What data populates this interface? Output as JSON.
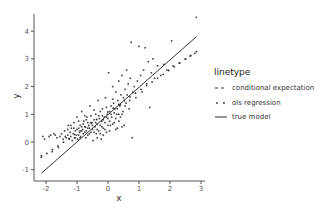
{
  "chart_data": {
    "type": "scatter",
    "title": "",
    "xlabel": "x",
    "ylabel": "y",
    "xlim": [
      -2.35,
      3.05
    ],
    "ylim": [
      -1.45,
      4.85
    ],
    "xticks": [
      -2,
      -1,
      0,
      1,
      2,
      3
    ],
    "yticks": [
      -1,
      0,
      1,
      2,
      3,
      4
    ],
    "grid": false,
    "legend": {
      "title": "linetype",
      "position": "right",
      "entries": [
        {
          "label": "conditional expectation",
          "style": "dashed"
        },
        {
          "label": "ols regression",
          "style": "dotted"
        },
        {
          "label": "true model",
          "style": "solid"
        }
      ]
    },
    "lines": [
      {
        "name": "true model",
        "style": "solid",
        "x": [
          -2.15,
          2.85
        ],
        "y": [
          -1.13,
          3.8
        ]
      },
      {
        "name": "ols regression",
        "style": "dotted",
        "x": [
          -2.15,
          2.85
        ],
        "y": [
          -0.55,
          3.26
        ]
      }
    ],
    "scatter_summary": {
      "n_points_approx": 500,
      "x_range": [
        -2.15,
        2.85
      ],
      "y_range": [
        -0.5,
        4.5
      ],
      "cluster_center": [
        -0.5,
        0.6
      ]
    },
    "points": [
      [
        -2.15,
        -0.5
      ],
      [
        -2.1,
        0.2
      ],
      [
        -2.05,
        0.1
      ],
      [
        -1.9,
        0.2
      ],
      [
        -1.85,
        0.25
      ],
      [
        -1.8,
        -0.35
      ],
      [
        -1.75,
        0.3
      ],
      [
        -1.7,
        0.25
      ],
      [
        -1.65,
        0.15
      ],
      [
        -1.6,
        -0.2
      ],
      [
        -1.55,
        0.2
      ],
      [
        -1.5,
        0.3
      ],
      [
        -1.45,
        0.1
      ],
      [
        -1.4,
        0.4
      ],
      [
        -1.38,
        0.2
      ],
      [
        -1.35,
        0.15
      ],
      [
        -1.3,
        0.25
      ],
      [
        -1.28,
        0.6
      ],
      [
        -1.25,
        0.1
      ],
      [
        -1.22,
        0.35
      ],
      [
        -1.2,
        0.2
      ],
      [
        -1.18,
        0.5
      ],
      [
        -1.15,
        0.05
      ],
      [
        -1.12,
        0.3
      ],
      [
        -1.1,
        0.7
      ],
      [
        -1.08,
        0.15
      ],
      [
        -1.05,
        0.4
      ],
      [
        -1.02,
        0.25
      ],
      [
        -1.0,
        0.9
      ],
      [
        -0.98,
        0.1
      ],
      [
        -0.95,
        0.5
      ],
      [
        -0.92,
        0.35
      ],
      [
        -0.9,
        0.6
      ],
      [
        -0.88,
        0.2
      ],
      [
        -0.85,
        1.1
      ],
      [
        -0.82,
        0.45
      ],
      [
        -0.8,
        0.3
      ],
      [
        -0.78,
        0.75
      ],
      [
        -0.75,
        0.55
      ],
      [
        -0.72,
        0.15
      ],
      [
        -0.7,
        0.4
      ],
      [
        -0.68,
        0.9
      ],
      [
        -0.65,
        0.25
      ],
      [
        -0.62,
        0.6
      ],
      [
        -0.6,
        0.5
      ],
      [
        -0.58,
        1.3
      ],
      [
        -0.55,
        0.35
      ],
      [
        -0.52,
        0.7
      ],
      [
        -0.5,
        0.45
      ],
      [
        -0.48,
        0.05
      ],
      [
        -0.45,
        0.8
      ],
      [
        -0.42,
        0.55
      ],
      [
        -0.4,
        1.0
      ],
      [
        -0.38,
        0.3
      ],
      [
        -0.35,
        0.65
      ],
      [
        -0.32,
        1.5
      ],
      [
        -0.3,
        0.4
      ],
      [
        -0.28,
        0.85
      ],
      [
        -0.25,
        0.6
      ],
      [
        -0.22,
        0.1
      ],
      [
        -0.2,
        0.75
      ],
      [
        -0.18,
        1.2
      ],
      [
        -0.15,
        0.5
      ],
      [
        -0.12,
        0.9
      ],
      [
        -0.1,
        0.7
      ],
      [
        -0.08,
        1.6
      ],
      [
        -0.05,
        0.35
      ],
      [
        -0.02,
        1.0
      ],
      [
        0.0,
        0.85
      ],
      [
        0.02,
        2.5
      ],
      [
        0.05,
        1.1
      ],
      [
        0.08,
        0.6
      ],
      [
        0.1,
        1.3
      ],
      [
        0.12,
        0.9
      ],
      [
        0.15,
        2.0
      ],
      [
        0.18,
        1.4
      ],
      [
        0.2,
        0.7
      ],
      [
        0.22,
        1.2
      ],
      [
        0.25,
        1.8
      ],
      [
        0.28,
        1.0
      ],
      [
        0.3,
        0.5
      ],
      [
        0.32,
        1.5
      ],
      [
        0.35,
        2.2
      ],
      [
        0.38,
        1.3
      ],
      [
        0.4,
        0.9
      ],
      [
        0.42,
        1.7
      ],
      [
        0.45,
        2.4
      ],
      [
        0.48,
        1.1
      ],
      [
        0.5,
        1.6
      ],
      [
        0.52,
        0.6
      ],
      [
        0.55,
        1.9
      ],
      [
        0.58,
        1.4
      ],
      [
        0.6,
        2.6
      ],
      [
        0.62,
        1.7
      ],
      [
        0.65,
        2.1
      ],
      [
        0.68,
        1.2
      ],
      [
        0.7,
        1.5
      ],
      [
        0.72,
        2.3
      ],
      [
        0.75,
        3.6
      ],
      [
        0.78,
        0.15
      ],
      [
        0.8,
        1.8
      ],
      [
        0.85,
        2.0
      ],
      [
        0.9,
        1.6
      ],
      [
        0.95,
        2.2
      ],
      [
        1.0,
        3.45
      ],
      [
        1.05,
        2.4
      ],
      [
        1.1,
        1.8
      ],
      [
        1.15,
        2.6
      ],
      [
        1.2,
        3.4
      ],
      [
        1.25,
        2.1
      ],
      [
        1.3,
        2.9
      ],
      [
        1.35,
        1.25
      ],
      [
        1.4,
        2.5
      ],
      [
        1.45,
        3.0
      ],
      [
        1.5,
        2.3
      ],
      [
        1.6,
        2.75
      ],
      [
        1.7,
        2.4
      ],
      [
        1.8,
        2.8
      ],
      [
        1.9,
        2.6
      ],
      [
        2.05,
        3.65
      ],
      [
        2.1,
        2.75
      ],
      [
        2.3,
        2.85
      ],
      [
        2.5,
        3.0
      ],
      [
        2.65,
        3.1
      ],
      [
        2.8,
        3.2
      ],
      [
        2.85,
        4.5
      ],
      [
        -1.0,
        0.45
      ],
      [
        -0.95,
        0.25
      ],
      [
        -0.9,
        0.15
      ],
      [
        -0.85,
        0.55
      ],
      [
        -0.8,
        0.65
      ],
      [
        -0.75,
        0.35
      ],
      [
        -0.7,
        0.8
      ],
      [
        -0.65,
        0.5
      ],
      [
        -0.6,
        0.3
      ],
      [
        -0.55,
        0.7
      ],
      [
        -0.5,
        0.6
      ],
      [
        -0.45,
        0.35
      ],
      [
        -0.4,
        0.7
      ],
      [
        -0.35,
        0.45
      ],
      [
        -0.3,
        0.95
      ],
      [
        -0.25,
        0.3
      ],
      [
        -0.2,
        0.55
      ],
      [
        -0.15,
        0.8
      ],
      [
        -0.1,
        0.45
      ],
      [
        -0.05,
        0.9
      ],
      [
        0.0,
        0.6
      ],
      [
        0.05,
        0.75
      ],
      [
        0.1,
        1.0
      ],
      [
        0.15,
        0.65
      ],
      [
        0.2,
        1.05
      ],
      [
        0.25,
        0.85
      ],
      [
        0.3,
        1.2
      ],
      [
        0.35,
        0.75
      ],
      [
        0.4,
        1.35
      ],
      [
        0.45,
        1.0
      ],
      [
        -1.3,
        0.45
      ],
      [
        -1.2,
        0.6
      ],
      [
        -1.1,
        0.5
      ],
      [
        -1.05,
        0.15
      ],
      [
        -0.95,
        0.75
      ],
      [
        -0.85,
        0.4
      ],
      [
        -0.75,
        0.95
      ],
      [
        -0.65,
        0.7
      ],
      [
        -0.55,
        0.95
      ],
      [
        -0.45,
        1.15
      ],
      [
        -0.35,
        0.15
      ],
      [
        -0.25,
        1.1
      ],
      [
        -0.15,
        0.25
      ],
      [
        -0.05,
        1.25
      ],
      [
        0.05,
        0.4
      ],
      [
        0.15,
        1.55
      ],
      [
        0.25,
        0.45
      ],
      [
        0.35,
        1.0
      ],
      [
        0.45,
        0.55
      ],
      [
        0.55,
        1.3
      ]
    ]
  }
}
